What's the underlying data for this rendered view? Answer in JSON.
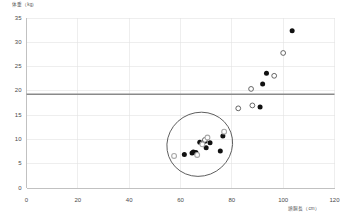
{
  "chart_data": {
    "type": "scatter",
    "title": "",
    "xlabel": "頭胴長（cm）",
    "ylabel": "体重（kg）",
    "xlim": [
      0,
      120
    ],
    "ylim": [
      0,
      35
    ],
    "xticks": [
      0,
      20,
      40,
      60,
      80,
      100,
      120
    ],
    "yticks": [
      0,
      5,
      10,
      15,
      20,
      25,
      30,
      35
    ],
    "grid": true,
    "legend": "none",
    "reference_line": {
      "orientation": "horizontal",
      "value": 19.3,
      "color": "#8a8a8a",
      "label": ""
    },
    "annotations": [
      {
        "type": "ellipse",
        "center_x": 67.5,
        "center_y": 9.0,
        "width": 26.0,
        "height": 13.0,
        "rotation_deg": -32,
        "color": "#555555",
        "label": ""
      }
    ],
    "series": [
      {
        "name": "filled",
        "marker": "filled-circle",
        "color": "#111111",
        "points": [
          [
            103.5,
            32.4
          ],
          [
            93.5,
            23.6
          ],
          [
            92.0,
            21.4
          ],
          [
            91.0,
            16.7
          ],
          [
            76.5,
            10.7
          ],
          [
            75.5,
            7.6
          ],
          [
            71.5,
            9.3
          ],
          [
            70.0,
            8.3
          ],
          [
            69.5,
            9.6
          ],
          [
            67.5,
            9.4
          ],
          [
            66.0,
            7.3
          ],
          [
            65.0,
            7.4
          ],
          [
            64.5,
            7.2
          ],
          [
            61.5,
            6.9
          ]
        ]
      },
      {
        "name": "open",
        "marker": "open-circle",
        "color": "#4d4d4d",
        "points": [
          [
            100.0,
            27.8
          ],
          [
            96.5,
            23.1
          ],
          [
            87.5,
            20.4
          ],
          [
            88.0,
            17.0
          ],
          [
            82.5,
            16.4
          ],
          [
            69.5,
            9.9
          ]
        ]
      },
      {
        "name": "gray",
        "marker": "gray-circle",
        "color": "#a8a8a8",
        "points": [
          [
            77.0,
            11.6
          ],
          [
            70.5,
            10.4
          ],
          [
            68.5,
            9.0
          ],
          [
            66.5,
            6.8
          ],
          [
            57.5,
            6.6
          ]
        ]
      }
    ]
  },
  "axis": {
    "y_title": "体重（kg）",
    "x_title": "頭胴長（cm）",
    "x_tick_labels": [
      "0",
      "20",
      "40",
      "60",
      "80",
      "100",
      "120"
    ],
    "y_tick_labels": [
      "0",
      "5",
      "10",
      "15",
      "20",
      "25",
      "30",
      "35"
    ]
  },
  "colors": {
    "background": "#ffffff",
    "gridline": "#e2e2e2",
    "axis": "#b5b5b5",
    "reference_line": "#8a8a8a",
    "marker_filled": "#111111",
    "marker_open_stroke": "#4d4d4d",
    "marker_gray": "#a8a8a8",
    "ellipse_stroke": "#555555",
    "text": "#4a4a4a"
  }
}
